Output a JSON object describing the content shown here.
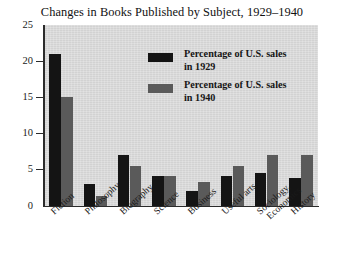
{
  "chart_data": {
    "type": "bar",
    "title": "Changes in Books Published by Subject, 1929–1940",
    "xlabel": "",
    "ylabel": "",
    "ylim": [
      0,
      25
    ],
    "yticks": [
      0,
      5,
      10,
      15,
      20,
      25
    ],
    "ytick_labels": [
      "0",
      "5",
      "10",
      "15",
      "20",
      "25"
    ],
    "grid": false,
    "legend_position": "upper-center-inside",
    "categories": [
      "Fiction",
      "Philosophy",
      "Biography",
      "Science",
      "Business",
      "Useful arts",
      "Sociology, Economics",
      "History"
    ],
    "category_lines": [
      [
        "Fiction"
      ],
      [
        "Philosophy"
      ],
      [
        "Biography"
      ],
      [
        "Science"
      ],
      [
        "Business"
      ],
      [
        "Useful arts"
      ],
      [
        "Sociology,",
        "Economics"
      ],
      [
        "History"
      ]
    ],
    "series": [
      {
        "name": "Percentage of U.S. sales in 1929",
        "color": "#141414",
        "values": [
          21.0,
          3.0,
          7.0,
          4.2,
          2.1,
          4.1,
          4.6,
          3.9
        ]
      },
      {
        "name": "Percentage of U.S. sales in 1940",
        "color": "#5a5a5a",
        "values": [
          15.0,
          1.4,
          5.5,
          4.2,
          3.3,
          5.5,
          7.0,
          7.0
        ]
      }
    ],
    "plot_background": "#d9d9d9",
    "figure_background": "#ffffff"
  },
  "legend": {
    "entries": [
      {
        "line1": "Percentage of U.S. sales",
        "line2": "in 1929",
        "color": "#141414"
      },
      {
        "line1": "Percentage of U.S. sales",
        "line2": "in 1940",
        "color": "#5a5a5a"
      }
    ]
  }
}
